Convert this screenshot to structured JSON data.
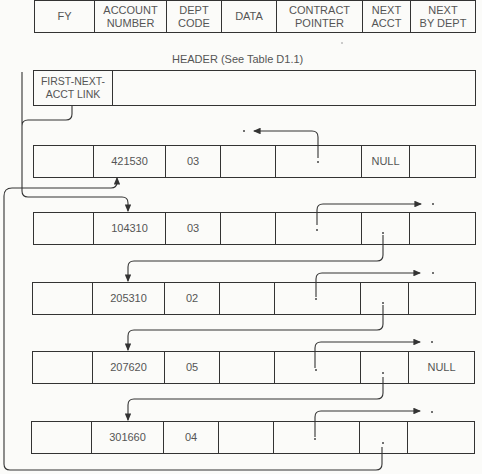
{
  "record_layout": {
    "fields": [
      "FY",
      "ACCOUNT\nNUMBER",
      "DEPT\nCODE",
      "DATA",
      "CONTRACT\nPOINTER",
      "NEXT\nACCT",
      "NEXT\nBY DEPT"
    ]
  },
  "header": {
    "title": "HEADER (See Table D1.1)",
    "first_field": "FIRST-NEXT-\nACCT LINK",
    "rest": ""
  },
  "records": [
    {
      "fy": "",
      "account": "421530",
      "dept": "03",
      "data": "",
      "contract": "·",
      "next_acct": "NULL",
      "next_by_dept": ""
    },
    {
      "fy": "",
      "account": "104310",
      "dept": "03",
      "data": "",
      "contract": "·",
      "next_acct": "·",
      "next_by_dept": ""
    },
    {
      "fy": "",
      "account": "205310",
      "dept": "02",
      "data": "",
      "contract": "·",
      "next_acct": "·",
      "next_by_dept": ""
    },
    {
      "fy": "",
      "account": "207620",
      "dept": "05",
      "data": "",
      "contract": "·",
      "next_acct": "·",
      "next_by_dept": "NULL"
    },
    {
      "fy": "",
      "account": "301660",
      "dept": "04",
      "data": "",
      "contract": "·",
      "next_acct": "·",
      "next_by_dept": ""
    }
  ]
}
